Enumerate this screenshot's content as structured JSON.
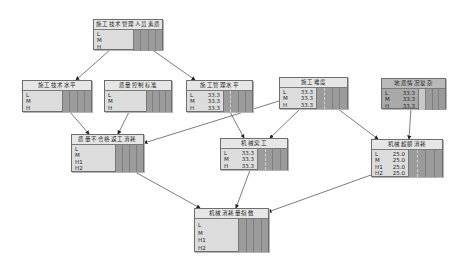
{
  "diagram": {
    "type": "bayesian-network",
    "nodes": [
      {
        "id": "n1",
        "title": "施工技术管理人员素质",
        "states": [
          {
            "label": "L",
            "value": ""
          },
          {
            "label": "M",
            "value": ""
          },
          {
            "label": "H",
            "value": ""
          }
        ]
      },
      {
        "id": "n2",
        "title": "施工技术水平",
        "states": [
          {
            "label": "L",
            "value": ""
          },
          {
            "label": "M",
            "value": ""
          },
          {
            "label": "H",
            "value": ""
          }
        ]
      },
      {
        "id": "n3",
        "title": "质量控制标准",
        "states": [
          {
            "label": "L",
            "value": ""
          },
          {
            "label": "M",
            "value": ""
          },
          {
            "label": "H",
            "value": ""
          }
        ]
      },
      {
        "id": "n4",
        "title": "施工管理水平",
        "states": [
          {
            "label": "L",
            "value": "33.3"
          },
          {
            "label": "M",
            "value": "33.3"
          },
          {
            "label": "H",
            "value": "33.3"
          }
        ]
      },
      {
        "id": "n5",
        "title": "施工难度",
        "states": [
          {
            "label": "L",
            "value": "33.3"
          },
          {
            "label": "M",
            "value": "33.3"
          },
          {
            "label": "H",
            "value": "33.3"
          }
        ]
      },
      {
        "id": "n6",
        "title": "地质情况复杂",
        "states": [
          {
            "label": "L",
            "value": "33.3"
          },
          {
            "label": "M",
            "value": "33.3"
          },
          {
            "label": "H",
            "value": "33.3"
          }
        ]
      },
      {
        "id": "n7",
        "title": "质量不合格返工消耗",
        "states": [
          {
            "label": "L",
            "value": ""
          },
          {
            "label": "M",
            "value": ""
          },
          {
            "label": "H1",
            "value": ""
          },
          {
            "label": "H2",
            "value": ""
          }
        ]
      },
      {
        "id": "n8",
        "title": "机械窝工",
        "states": [
          {
            "label": "L",
            "value": "33.3"
          },
          {
            "label": "M",
            "value": "33.3"
          },
          {
            "label": "H",
            "value": "33.3"
          }
        ]
      },
      {
        "id": "n9",
        "title": "机械超额消耗",
        "states": [
          {
            "label": "L",
            "value": "25.0"
          },
          {
            "label": "M",
            "value": "25.0"
          },
          {
            "label": "H1",
            "value": "25.0"
          },
          {
            "label": "H2",
            "value": "25.0"
          }
        ]
      },
      {
        "id": "n10",
        "title": "机械消耗量指数",
        "states": [
          {
            "label": "L",
            "value": ""
          },
          {
            "label": "M",
            "value": ""
          },
          {
            "label": "H1",
            "value": ""
          },
          {
            "label": "H2",
            "value": ""
          }
        ]
      }
    ],
    "edges": [
      {
        "from": "施工技术管理人员素质",
        "to": "施工技术水平"
      },
      {
        "from": "施工技术管理人员素质",
        "to": "施工管理水平"
      },
      {
        "from": "施工技术水平",
        "to": "质量不合格返工消耗"
      },
      {
        "from": "质量控制标准",
        "to": "质量不合格返工消耗"
      },
      {
        "from": "施工难度",
        "to": "质量不合格返工消耗"
      },
      {
        "from": "施工管理水平",
        "to": "机械窝工"
      },
      {
        "from": "施工难度",
        "to": "机械窝工"
      },
      {
        "from": "施工难度",
        "to": "机械超额消耗"
      },
      {
        "from": "地质情况复杂",
        "to": "机械超额消耗"
      },
      {
        "from": "质量不合格返工消耗",
        "to": "机械消耗量指数"
      },
      {
        "from": "机械窝工",
        "to": "机械消耗量指数"
      },
      {
        "from": "机械超额消耗",
        "to": "机械消耗量指数"
      }
    ],
    "colors": {
      "node_fill": "#dcdcdc",
      "bar_fill": "#9b9b9b",
      "border": "#6e6e6e",
      "edge": "#333333"
    }
  }
}
